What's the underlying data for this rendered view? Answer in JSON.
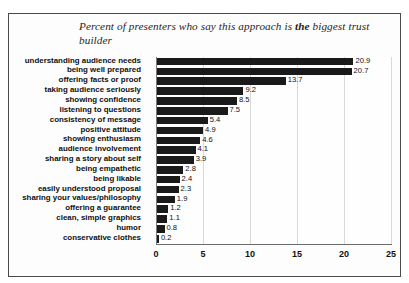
{
  "chart_data": {
    "type": "bar",
    "orientation": "horizontal",
    "title": "Percent of presenters who say this approach is the biggest trust builder",
    "title_parts": {
      "before": "Percent of presenters who say this approach is ",
      "emphasis": "the",
      "after": " biggest trust builder"
    },
    "xlabel": "",
    "ylabel": "",
    "xlim": [
      0,
      25
    ],
    "xticks": [
      0,
      5,
      10,
      15,
      20,
      25
    ],
    "grid": true,
    "legend": false,
    "bar_color": "#1a1a1a",
    "categories": [
      "understanding audience needs",
      "being well prepared",
      "offering facts or proof",
      "taking audience seriously",
      "showing confidence",
      "listening to questions",
      "consistency of message",
      "positive attitude",
      "showing enthusiasm",
      "audience involvement",
      "sharing a story about self",
      "being empathetic",
      "being likable",
      "easily understood proposal",
      "sharing your values/philosophy",
      "offering a guarantee",
      "clean, simple graphics",
      "humor",
      "conservative clothes"
    ],
    "values": [
      20.9,
      20.7,
      13.7,
      9.2,
      8.5,
      7.5,
      5.4,
      4.9,
      4.6,
      4.1,
      3.9,
      2.8,
      2.4,
      2.3,
      1.9,
      1.2,
      1.1,
      0.8,
      0.2
    ],
    "value_labels": [
      "20.9",
      "20.7",
      "13.7",
      "9.2",
      "8.5",
      "7.5",
      "5.4",
      "4.9",
      "4.6",
      "4.1",
      "3.9",
      "2.8",
      "2.4",
      "2.3",
      "1.9",
      "1.2",
      "1.1",
      "0.8",
      "0.2"
    ],
    "xtick_labels": [
      "0",
      "5",
      "10",
      "15",
      "20",
      "25"
    ]
  }
}
